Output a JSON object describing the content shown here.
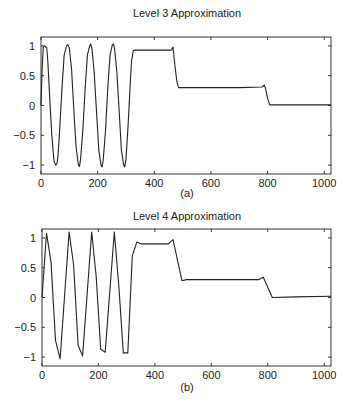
{
  "chart_data": [
    {
      "type": "line",
      "title": "Level 3 Approximation",
      "caption": "(a)",
      "xlabel": "",
      "ylabel": "",
      "xlim": [
        0,
        1024
      ],
      "ylim": [
        -1.15,
        1.15
      ],
      "xticks": [
        0,
        200,
        400,
        600,
        800,
        1000
      ],
      "xtick_labels": [
        "0",
        "200",
        "400",
        "600",
        "800",
        "1000"
      ],
      "yticks": [
        1,
        0.5,
        0,
        -0.5,
        -1
      ],
      "ytick_labels": [
        "1",
        "0.5",
        "0",
        "−0.5",
        "−1"
      ],
      "grid": false,
      "legend": null,
      "series": [
        {
          "name": "Level 3 approximation",
          "x": [
            0,
            4,
            8,
            12,
            20,
            24,
            30,
            38,
            46,
            52,
            56,
            60,
            66,
            74,
            82,
            90,
            95,
            100,
            108,
            116,
            124,
            132,
            136,
            140,
            148,
            156,
            164,
            172,
            176,
            180,
            188,
            196,
            204,
            212,
            216,
            220,
            228,
            236,
            244,
            252,
            256,
            260,
            268,
            276,
            284,
            292,
            296,
            300,
            308,
            316,
            320,
            326,
            330,
            400,
            460,
            466,
            472,
            480,
            486,
            520,
            600,
            700,
            780,
            788,
            792,
            800,
            808,
            850,
            900,
            1024
          ],
          "y": [
            0,
            0.6,
            0.98,
            1.0,
            0.97,
            0.75,
            0.2,
            -0.5,
            -0.93,
            -1.0,
            -0.98,
            -0.85,
            -0.4,
            0.3,
            0.85,
            1.0,
            1.02,
            0.97,
            0.6,
            -0.1,
            -0.7,
            -1.0,
            -1.02,
            -0.9,
            -0.4,
            0.3,
            0.85,
            1.0,
            1.03,
            0.95,
            0.55,
            -0.1,
            -0.75,
            -1.0,
            -1.03,
            -0.9,
            -0.4,
            0.3,
            0.85,
            1.02,
            1.03,
            0.95,
            0.55,
            -0.1,
            -0.75,
            -1.0,
            -1.03,
            -0.9,
            -0.3,
            0.45,
            0.75,
            0.92,
            0.93,
            0.93,
            0.93,
            0.98,
            0.7,
            0.4,
            0.3,
            0.3,
            0.3,
            0.3,
            0.31,
            0.34,
            0.3,
            0.12,
            0.01,
            0.01,
            0.01,
            0.01
          ]
        }
      ]
    },
    {
      "type": "line",
      "title": "Level 4 Approximation",
      "caption": "(b)",
      "xlabel": "",
      "ylabel": "",
      "xlim": [
        0,
        1024
      ],
      "ylim": [
        -1.15,
        1.15
      ],
      "xticks": [
        0,
        200,
        400,
        600,
        800,
        1000
      ],
      "xtick_labels": [
        "0",
        "200",
        "400",
        "600",
        "800",
        "1000"
      ],
      "yticks": [
        1,
        0.5,
        0,
        -0.5,
        -1
      ],
      "ytick_labels": [
        "1",
        "0.5",
        "0",
        "−0.5",
        "−1"
      ],
      "grid": false,
      "legend": null,
      "series": [
        {
          "name": "Level 4 approximation",
          "x": [
            0,
            16,
            32,
            48,
            64,
            96,
            112,
            128,
            144,
            176,
            192,
            208,
            224,
            256,
            272,
            288,
            304,
            320,
            336,
            352,
            400,
            448,
            464,
            496,
            512,
            600,
            700,
            768,
            784,
            816,
            900,
            1024
          ],
          "y": [
            0,
            1.08,
            0.6,
            -0.72,
            -1.03,
            1.1,
            0.55,
            -0.8,
            -0.98,
            1.1,
            0.35,
            -0.87,
            -0.92,
            1.1,
            0.2,
            -0.93,
            -0.93,
            0.7,
            0.93,
            0.9,
            0.9,
            0.9,
            0.97,
            0.28,
            0.3,
            0.3,
            0.3,
            0.3,
            0.34,
            0.0,
            0.01,
            0.02
          ]
        }
      ]
    }
  ]
}
